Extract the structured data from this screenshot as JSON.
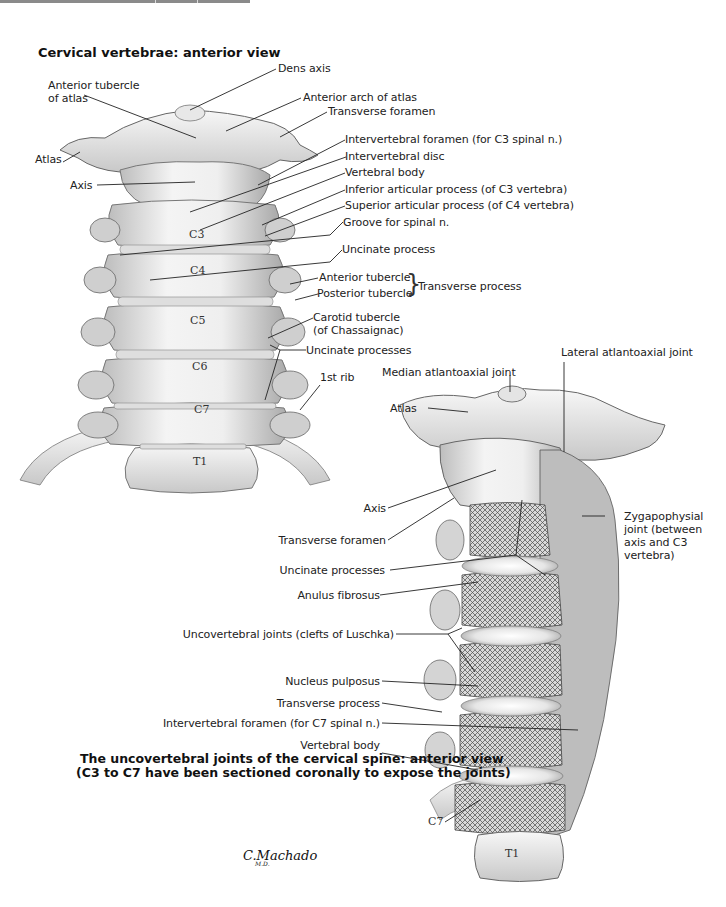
{
  "figure_top": {
    "title": "Cervical vertebrae: anterior view",
    "labels": {
      "dens_axis": "Dens axis",
      "anterior_tubercle_atlas_1": "Anterior tubercle",
      "anterior_tubercle_atlas_2": "of atlas",
      "anterior_arch_atlas": "Anterior arch of atlas",
      "transverse_foramen": "Transverse foramen",
      "atlas": "Atlas",
      "axis": "Axis",
      "intervertebral_foramen": "Intervertebral foramen (for C3 spinal n.)",
      "intervertebral_disc": "Intervertebral disc",
      "vertebral_body": "Vertebral body",
      "inferior_articular": "Inferior articular process (of C3 vertebra)",
      "superior_articular": "Superior articular process (of C4 vertebra)",
      "groove_spinal": "Groove for spinal n.",
      "uncinate_process": "Uncinate process",
      "anterior_tubercle": "Anterior tubercle",
      "posterior_tubercle": "Posterior tubercle",
      "transverse_process": "Transverse process",
      "carotid_tubercle_1": "Carotid tubercle",
      "carotid_tubercle_2": "(of Chassaignac)",
      "uncinate_processes": "Uncinate processes",
      "first_rib": "1st rib"
    },
    "vertebrae": [
      "C3",
      "C4",
      "C5",
      "C6",
      "C7",
      "T1"
    ]
  },
  "figure_bottom": {
    "caption_line1": "The uncovertebral joints of the cervical spine: anterior view",
    "caption_line2": "(C3 to C7 have been sectioned coronally to expose the joints)",
    "labels": {
      "median_atlantoaxial": "Median atlantoaxial joint",
      "lateral_atlantoaxial": "Lateral atlantoaxial joint",
      "atlas": "Atlas",
      "axis": "Axis",
      "transverse_foramen": "Transverse foramen",
      "zygapophysial": "Zygapophysial joint (between axis and C3 vertebra)",
      "uncinate_processes": "Uncinate processes",
      "anulus_fibrosus": "Anulus fibrosus",
      "uncovertebral_joints": "Uncovertebral joints (clefts of Luschka)",
      "nucleus_pulposus": "Nucleus pulposus",
      "transverse_process": "Transverse process",
      "intervertebral_foramen": "Intervertebral foramen (for C7 spinal n.)",
      "vertebral_body": "Vertebral body",
      "c7": "C7",
      "t1": "T1"
    }
  },
  "signature": {
    "name": "C.Machado",
    "suffix": "M.D."
  }
}
